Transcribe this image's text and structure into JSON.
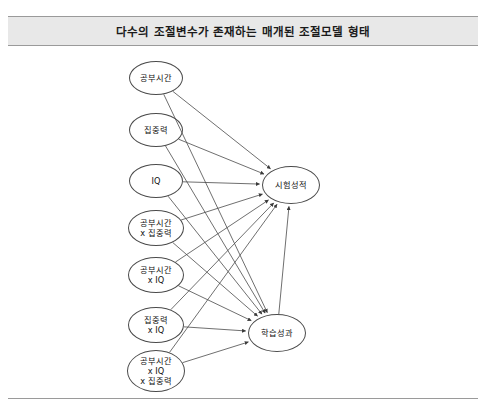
{
  "header": {
    "title": "다수의 조절변수가 존재하는 매개된 조절모델 형태"
  },
  "diagram": {
    "type": "path-model",
    "predictors": [
      {
        "id": "study-time",
        "label": "공부시간",
        "cx": 156,
        "cy": 78,
        "rx": 27,
        "ry": 17
      },
      {
        "id": "concentration",
        "label": "집중력",
        "cx": 156,
        "cy": 130,
        "rx": 27,
        "ry": 17
      },
      {
        "id": "iq",
        "label": "IQ",
        "cx": 156,
        "cy": 181,
        "rx": 27,
        "ry": 17
      },
      {
        "id": "study-x-conc",
        "label": "공부시간\nx 집중력",
        "cx": 156,
        "cy": 228,
        "rx": 28,
        "ry": 18
      },
      {
        "id": "study-x-iq",
        "label": "공부시간\nx IQ",
        "cx": 156,
        "cy": 275,
        "rx": 28,
        "ry": 18
      },
      {
        "id": "conc-x-iq",
        "label": "집중력\nx IQ",
        "cx": 156,
        "cy": 325,
        "rx": 28,
        "ry": 18
      },
      {
        "id": "study-x-iq-x-conc",
        "label": "공부시간\nx IQ\nx 집중력",
        "cx": 156,
        "cy": 371,
        "rx": 29,
        "ry": 21
      }
    ],
    "outcomes": [
      {
        "id": "exam-score",
        "label": "시험성적",
        "cx": 291,
        "cy": 185,
        "rx": 29,
        "ry": 19
      },
      {
        "id": "learning-outcome",
        "label": "학습성과",
        "cx": 277,
        "cy": 333,
        "rx": 29,
        "ry": 19
      }
    ],
    "edges": [
      {
        "from": "study-time",
        "to": "exam-score"
      },
      {
        "from": "concentration",
        "to": "exam-score"
      },
      {
        "from": "iq",
        "to": "exam-score"
      },
      {
        "from": "study-x-conc",
        "to": "exam-score"
      },
      {
        "from": "study-x-iq",
        "to": "exam-score"
      },
      {
        "from": "conc-x-iq",
        "to": "exam-score"
      },
      {
        "from": "study-x-iq-x-conc",
        "to": "exam-score"
      },
      {
        "from": "study-time",
        "to": "learning-outcome"
      },
      {
        "from": "concentration",
        "to": "learning-outcome"
      },
      {
        "from": "iq",
        "to": "learning-outcome"
      },
      {
        "from": "study-x-conc",
        "to": "learning-outcome"
      },
      {
        "from": "study-x-iq",
        "to": "learning-outcome"
      },
      {
        "from": "conc-x-iq",
        "to": "learning-outcome"
      },
      {
        "from": "study-x-iq-x-conc",
        "to": "learning-outcome"
      },
      {
        "from": "learning-outcome",
        "to": "exam-score"
      }
    ]
  },
  "style": {
    "line_color": "#4a4a4a",
    "node_border": "#4a4a4a",
    "band_fill": "#e8e8e8",
    "band_rule": "#9a9a9a",
    "text_color": "#111111"
  }
}
